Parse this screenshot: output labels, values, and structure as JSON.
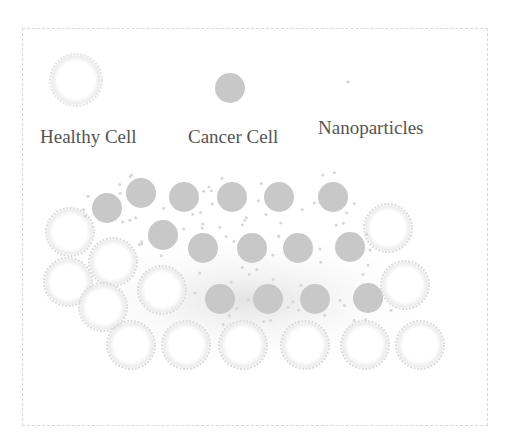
{
  "legend": {
    "healthy_label": "Healthy Cell",
    "cancer_label": "Cancer Cell",
    "nano_label": "Nanoparticles"
  },
  "colors": {
    "cancer_cell": "#c8c8c8",
    "healthy_cell_edge": "#dcdcdc",
    "nanoparticle": "#d6d6d6",
    "text": "#555555",
    "frame": "#d8d8d8"
  },
  "cells": {
    "healthy": [
      [
        70,
        232
      ],
      [
        113,
        262
      ],
      [
        68,
        282
      ],
      [
        103,
        307
      ],
      [
        162,
        290
      ],
      [
        131,
        345
      ],
      [
        186,
        345
      ],
      [
        243,
        345
      ],
      [
        305,
        345
      ],
      [
        365,
        345
      ],
      [
        420,
        345
      ],
      [
        388,
        228
      ],
      [
        405,
        285
      ]
    ],
    "cancer": [
      [
        107,
        208
      ],
      [
        141,
        193
      ],
      [
        184,
        197
      ],
      [
        232,
        197
      ],
      [
        279,
        197
      ],
      [
        333,
        197
      ],
      [
        163,
        235
      ],
      [
        203,
        248
      ],
      [
        252,
        248
      ],
      [
        298,
        248
      ],
      [
        350,
        247
      ],
      [
        220,
        299
      ],
      [
        268,
        299
      ],
      [
        315,
        299
      ],
      [
        368,
        298
      ]
    ]
  }
}
